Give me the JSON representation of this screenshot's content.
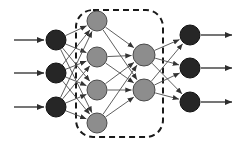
{
  "diagram": {
    "type": "neural-network-architecture",
    "title": "",
    "width": 244,
    "height": 147,
    "background_color": "#ffffff",
    "colors": {
      "input_node_fill": "#262626",
      "input_node_stroke": "#111111",
      "hidden_node_fill": "#8d8d8d",
      "hidden_node_stroke": "#4a4a4a",
      "output_node_fill": "#262626",
      "output_node_stroke": "#111111",
      "edge_stroke": "#4d4d4d",
      "io_arrow_stroke": "#3a3a3a",
      "dashed_box_stroke": "#1a1a1a"
    },
    "dashed_box": {
      "label": "hidden-layers-group",
      "x": 76,
      "y": 10,
      "width": 87,
      "height": 127,
      "corner_radius": 17,
      "dash_pattern": "6 4",
      "stroke_width": 2
    },
    "layers": [
      {
        "name": "input-layer",
        "kind": "input",
        "node_count": 3,
        "node_radius": 10,
        "fill": "#262626",
        "nodes": [
          {
            "id": "in-1",
            "cx": 56,
            "cy": 40,
            "label": ""
          },
          {
            "id": "in-2",
            "cx": 56,
            "cy": 73,
            "label": ""
          },
          {
            "id": "in-3",
            "cx": 56,
            "cy": 107,
            "label": ""
          }
        ]
      },
      {
        "name": "hidden-layer-1",
        "kind": "hidden",
        "node_count": 4,
        "node_radius": 10,
        "fill": "#8d8d8d",
        "nodes": [
          {
            "id": "h1-1",
            "cx": 97,
            "cy": 21,
            "label": ""
          },
          {
            "id": "h1-2",
            "cx": 97,
            "cy": 57,
            "label": ""
          },
          {
            "id": "h1-3",
            "cx": 97,
            "cy": 90,
            "label": ""
          },
          {
            "id": "h1-4",
            "cx": 97,
            "cy": 123,
            "label": ""
          }
        ]
      },
      {
        "name": "hidden-layer-2",
        "kind": "hidden",
        "node_count": 2,
        "node_radius": 11,
        "fill": "#8d8d8d",
        "nodes": [
          {
            "id": "h2-1",
            "cx": 144,
            "cy": 55,
            "label": ""
          },
          {
            "id": "h2-2",
            "cx": 144,
            "cy": 90,
            "label": ""
          }
        ]
      },
      {
        "name": "output-layer",
        "kind": "output",
        "node_count": 3,
        "node_radius": 10,
        "fill": "#262626",
        "nodes": [
          {
            "id": "out-1",
            "cx": 190,
            "cy": 35,
            "label": ""
          },
          {
            "id": "out-2",
            "cx": 190,
            "cy": 68,
            "label": ""
          },
          {
            "id": "out-3",
            "cx": 190,
            "cy": 102,
            "label": ""
          }
        ]
      }
    ],
    "input_arrows": [
      {
        "id": "input-arrow-1",
        "x1": 14,
        "y1": 40,
        "x2": 44,
        "y2": 40
      },
      {
        "id": "input-arrow-2",
        "x1": 14,
        "y1": 73,
        "x2": 44,
        "y2": 73
      },
      {
        "id": "input-arrow-3",
        "x1": 14,
        "y1": 107,
        "x2": 44,
        "y2": 107
      }
    ],
    "output_arrows": [
      {
        "id": "output-arrow-1",
        "x1": 201,
        "y1": 35,
        "x2": 232,
        "y2": 35
      },
      {
        "id": "output-arrow-2",
        "x1": 201,
        "y1": 68,
        "x2": 232,
        "y2": 68
      },
      {
        "id": "output-arrow-3",
        "x1": 201,
        "y1": 102,
        "x2": 232,
        "y2": 102
      }
    ],
    "connections": {
      "input_to_hidden1": {
        "name": "fully-connected-input-to-hidden1",
        "from": [
          "in-1",
          "in-2",
          "in-3"
        ],
        "to": [
          "h1-1",
          "h1-2",
          "h1-3",
          "h1-4"
        ],
        "count": 12
      },
      "hidden1_to_hidden2": {
        "name": "fully-connected-hidden1-to-hidden2",
        "from": [
          "h1-1",
          "h1-2",
          "h1-3",
          "h1-4"
        ],
        "to": [
          "h2-1",
          "h2-2"
        ],
        "count": 8
      },
      "hidden2_to_output": {
        "name": "fully-connected-hidden2-to-output",
        "from": [
          "h2-1",
          "h2-2"
        ],
        "to": [
          "out-1",
          "out-2",
          "out-3"
        ],
        "count": 6
      }
    }
  }
}
